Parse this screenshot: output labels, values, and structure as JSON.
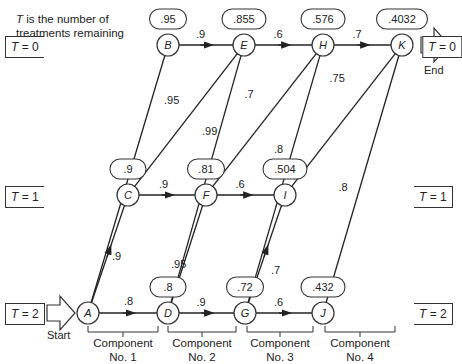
{
  "note": {
    "var": "T",
    "text": " is the number of",
    "line2": "treatments remaining"
  },
  "levels": {
    "t0": "= 0",
    "t1": "= 1",
    "t2": "= 2",
    "var": "T"
  },
  "captions": {
    "start": "Start",
    "end": "End"
  },
  "components": [
    {
      "line1": "Component",
      "line2": "No. 1"
    },
    {
      "line1": "Component",
      "line2": "No. 2"
    },
    {
      "line1": "Component",
      "line2": "No. 3"
    },
    {
      "line1": "Component",
      "line2": "No. 4"
    }
  ],
  "nodes": [
    {
      "id": "A",
      "x": 88,
      "y": 313,
      "value": ""
    },
    {
      "id": "B",
      "x": 168,
      "y": 45,
      "value": ".95"
    },
    {
      "id": "C",
      "x": 128,
      "y": 195,
      "value": ".9"
    },
    {
      "id": "D",
      "x": 168,
      "y": 313,
      "value": ".8"
    },
    {
      "id": "E",
      "x": 244,
      "y": 45,
      "value": ".855"
    },
    {
      "id": "F",
      "x": 206,
      "y": 195,
      "value": ".81"
    },
    {
      "id": "G",
      "x": 245,
      "y": 313,
      "value": ".72"
    },
    {
      "id": "H",
      "x": 323,
      "y": 45,
      "value": ".576"
    },
    {
      "id": "I",
      "x": 285,
      "y": 195,
      "value": ".504"
    },
    {
      "id": "J",
      "x": 323,
      "y": 313,
      "value": ".432"
    },
    {
      "id": "K",
      "x": 402,
      "y": 45,
      "value": ".4032"
    }
  ],
  "edges": [
    {
      "from": "A",
      "to": "B",
      "label": ".95"
    },
    {
      "from": "A",
      "to": "C",
      "label": ".9"
    },
    {
      "from": "A",
      "to": "D",
      "label": ".8"
    },
    {
      "from": "B",
      "to": "E",
      "label": ".9"
    },
    {
      "from": "C",
      "to": "E",
      "label": ".95"
    },
    {
      "from": "C",
      "to": "F",
      "label": ".9"
    },
    {
      "from": "D",
      "to": "E",
      "label": ".99"
    },
    {
      "from": "D",
      "to": "F",
      "label": ".95"
    },
    {
      "from": "D",
      "to": "G",
      "label": ".9"
    },
    {
      "from": "E",
      "to": "H",
      "label": ".6"
    },
    {
      "from": "F",
      "to": "H",
      "label": ".7"
    },
    {
      "from": "F",
      "to": "I",
      "label": ".6"
    },
    {
      "from": "G",
      "to": "H",
      "label": ".8"
    },
    {
      "from": "G",
      "to": "I",
      "label": ".7"
    },
    {
      "from": "G",
      "to": "J",
      "label": ".6"
    },
    {
      "from": "H",
      "to": "K",
      "label": ".7"
    },
    {
      "from": "I",
      "to": "K",
      "label": ".75"
    },
    {
      "from": "J",
      "to": "K",
      "label": ".8"
    }
  ]
}
